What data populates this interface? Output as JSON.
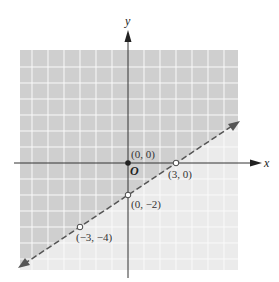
{
  "graph": {
    "axes": {
      "x_label": "x",
      "y_label": "y",
      "origin_label": "O"
    },
    "line": {
      "equation": "y = (2/3)x - 2",
      "style": "dashed",
      "boundary": "excluded"
    },
    "shaded_region": "above line (darker)",
    "points": [
      {
        "label": "(0, 0)",
        "x": 0,
        "y": 0,
        "filled": true
      },
      {
        "label": "(3, 0)",
        "x": 3,
        "y": 0,
        "filled": false
      },
      {
        "label": "(0, −2)",
        "x": 0,
        "y": -2,
        "filled": false
      },
      {
        "label": "(−3, −4)",
        "x": -3,
        "y": -4,
        "filled": false
      }
    ],
    "colors": {
      "shade_dark": "#cfcfcf",
      "shade_light": "#ebebeb",
      "grid": "#ffffff",
      "line": "#555555"
    }
  }
}
